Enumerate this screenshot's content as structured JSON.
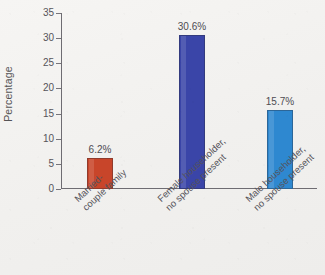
{
  "chart_data": {
    "type": "bar",
    "title": "",
    "xlabel": "",
    "ylabel": "Percentage",
    "ylim": [
      0,
      35
    ],
    "yticks": [
      0,
      5,
      10,
      15,
      20,
      25,
      30,
      35
    ],
    "ytick_labels": [
      "0",
      "5",
      "10",
      "15",
      "20",
      "25",
      "30",
      "35"
    ],
    "grid": false,
    "legend": false,
    "categories": [
      "Married-couple family",
      "Female householder, no spouse present",
      "Male householder, no spouse present"
    ],
    "category_lines": [
      [
        "Married-",
        "couple family"
      ],
      [
        "Female householder,",
        "no spouse present"
      ],
      [
        "Male householder,",
        "no spouse present"
      ]
    ],
    "values": [
      6.2,
      30.6,
      15.7
    ],
    "data_labels": [
      "6.2%",
      "30.6%",
      "15.7%"
    ],
    "bar_colors": [
      "#c8452a",
      "#3a45a8",
      "#2e88d0"
    ]
  },
  "axis": {
    "y_title": "Percentage"
  },
  "colors": {
    "background": "#f3f2f0",
    "axis_line": "#6e6c72",
    "text": "#55535a",
    "bar_red": "#c8452a",
    "bar_dark_blue": "#3a45a8",
    "bar_light_blue": "#2e88d0"
  }
}
